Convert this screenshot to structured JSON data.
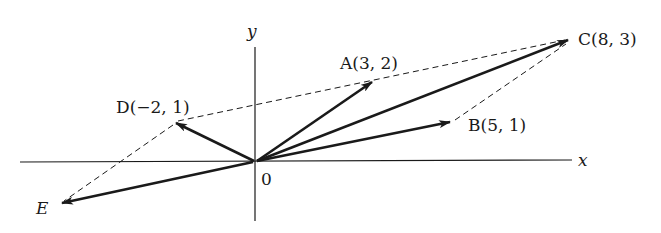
{
  "diagram": {
    "type": "vector-diagram",
    "axes": {
      "x_label": "x",
      "y_label": "y",
      "origin_label": "0"
    },
    "points": {
      "A": {
        "label": "A(3, 2)",
        "x": 3,
        "y": 2
      },
      "B": {
        "label": "B(5, 1)",
        "x": 5,
        "y": 1
      },
      "C": {
        "label": "C(8, 3)",
        "x": 8,
        "y": 3
      },
      "D": {
        "label": "D(−2, 1)",
        "x": -2,
        "y": 1
      },
      "E": {
        "label": "E"
      }
    },
    "vectors": [
      "0→A",
      "0→B",
      "0→C",
      "0→D",
      "0→E"
    ],
    "dashed_lines": [
      "A–C",
      "B–C",
      "D–A",
      "D–E"
    ],
    "colors": {
      "ink": "#1a1a1a",
      "background": "#ffffff"
    }
  }
}
